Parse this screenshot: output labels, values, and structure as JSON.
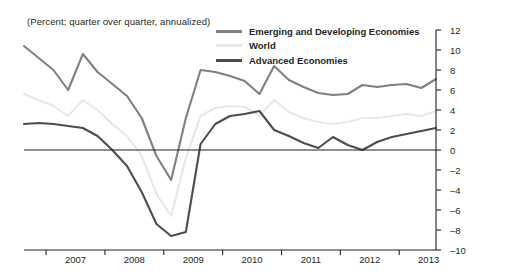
{
  "title": "(Percent; quarter over quarter, annualized)",
  "colors": {
    "emerging": "#808080",
    "world": "#e8e8e8",
    "advanced": "#4d4d4d",
    "axis": "#231f20",
    "zero_line": "#231f20"
  },
  "legend": {
    "position": "top-right",
    "items": [
      {
        "label": "Emerging and Developing Economies",
        "color": "#808080",
        "swatch": "line-swatch"
      },
      {
        "label": "World",
        "color": "#e8e8e8",
        "swatch": "line-swatch"
      },
      {
        "label": "Advanced Economies",
        "color": "#4d4d4d",
        "swatch": "line-swatch"
      }
    ]
  },
  "chart_data": {
    "type": "line",
    "title": "(Percent; quarter over quarter, annualized)",
    "xlabel": "",
    "ylabel": "",
    "ylim": [
      -10,
      12
    ],
    "yticks": [
      12,
      10,
      8,
      6,
      4,
      2,
      0,
      -2,
      -4,
      -6,
      -8,
      -10
    ],
    "ytick_labels": [
      "12",
      "10",
      "8",
      "6",
      "4",
      "2",
      "0",
      "–2",
      "–4",
      "–6",
      "–8",
      "–10"
    ],
    "y_axis_position": "right",
    "grid": false,
    "zero_line": true,
    "xtick_labels": [
      "2007",
      "2008",
      "2009",
      "2010",
      "2011",
      "2012",
      "2013"
    ],
    "x": [
      "2006Q3",
      "2006Q4",
      "2007Q1",
      "2007Q2",
      "2007Q3",
      "2007Q4",
      "2008Q1",
      "2008Q2",
      "2008Q3",
      "2008Q4",
      "2009Q1",
      "2009Q2",
      "2009Q3",
      "2009Q4",
      "2010Q1",
      "2010Q2",
      "2010Q3",
      "2010Q4",
      "2011Q1",
      "2011Q2",
      "2011Q3",
      "2011Q4",
      "2012Q1",
      "2012Q2",
      "2012Q3",
      "2012Q4",
      "2013Q1",
      "2013Q2",
      "2013Q3"
    ],
    "series": [
      {
        "name": "Emerging and Developing Economies",
        "color": "#808080",
        "values": [
          10.4,
          9.2,
          8.0,
          6.0,
          9.6,
          7.8,
          6.6,
          5.4,
          3.2,
          -0.6,
          -3.0,
          3.2,
          8.0,
          7.8,
          7.4,
          6.9,
          5.6,
          8.4,
          7.0,
          6.3,
          5.7,
          5.5,
          5.6,
          6.5,
          6.3,
          6.5,
          6.6,
          6.2,
          7.1
        ]
      },
      {
        "name": "World",
        "color": "#e8e8e8",
        "values": [
          5.6,
          5.0,
          4.4,
          3.4,
          5.0,
          4.0,
          2.6,
          1.4,
          -0.6,
          -4.4,
          -6.6,
          -0.8,
          3.4,
          4.2,
          4.4,
          4.3,
          3.4,
          5.0,
          3.8,
          3.2,
          2.8,
          2.6,
          2.8,
          3.2,
          3.2,
          3.4,
          3.6,
          3.4,
          3.9
        ]
      },
      {
        "name": "Advanced Economies",
        "color": "#4d4d4d",
        "values": [
          2.6,
          2.7,
          2.6,
          2.4,
          2.2,
          1.4,
          0.0,
          -1.6,
          -4.2,
          -7.4,
          -8.6,
          -8.2,
          0.6,
          2.6,
          3.4,
          3.6,
          3.9,
          2.0,
          1.4,
          0.7,
          0.2,
          1.3,
          0.5,
          0.0,
          0.8,
          1.3,
          1.6,
          1.9,
          2.2
        ]
      }
    ]
  }
}
